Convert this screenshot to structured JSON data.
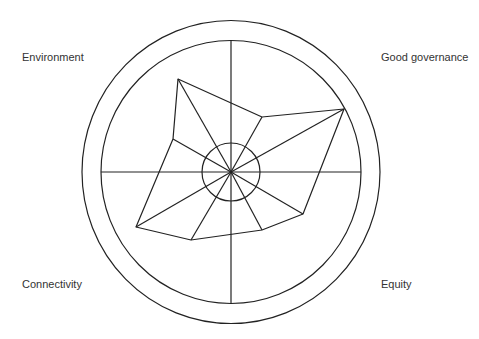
{
  "diagram": {
    "type": "radar-wheel",
    "center": [
      231,
      172
    ],
    "outer_ring": {
      "rx": 149,
      "ry": 151.5
    },
    "inner_ring": {
      "rx": 130,
      "ry": 131.5
    },
    "hub_radius": 29,
    "stroke_color": "#222222",
    "labels": {
      "top_left": "Environment",
      "top_right": "Good governance",
      "bottom_left": "Connectivity",
      "bottom_right": "Equity"
    },
    "polygon_vertices": [
      [
        178,
        79
      ],
      [
        262,
        117
      ],
      [
        344,
        109
      ],
      [
        303,
        214
      ],
      [
        262,
        230
      ],
      [
        191,
        240
      ],
      [
        136,
        227
      ],
      [
        173,
        139
      ]
    ]
  }
}
